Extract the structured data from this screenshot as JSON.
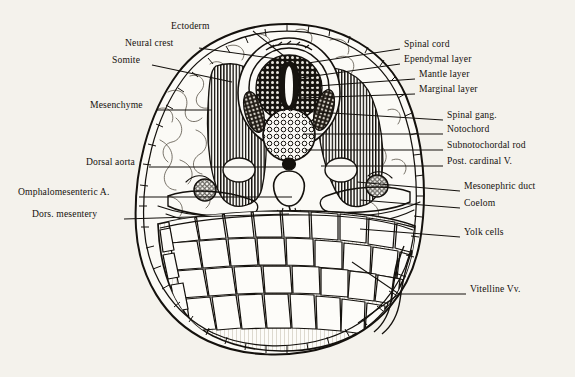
{
  "figure": {
    "clipped_header_text": "A 48, n 3 9",
    "background_color": "#f4f2ec",
    "ink_color": "#14110d"
  },
  "labels_left": [
    {
      "id": "ectoderm",
      "text": "Ectoderm",
      "text_x": 171,
      "text_y": 28,
      "anchor_x": 253,
      "anchor_y": 31,
      "tip_x": 284,
      "tip_y": 56
    },
    {
      "id": "neural-crest",
      "text": "Neural crest",
      "text_x": 125,
      "text_y": 45,
      "anchor_x": 199,
      "anchor_y": 48,
      "tip_x": 291,
      "tip_y": 61
    },
    {
      "id": "somite",
      "text": "Somite",
      "text_x": 112,
      "text_y": 62,
      "anchor_x": 152,
      "anchor_y": 65,
      "tip_x": 232,
      "tip_y": 82
    },
    {
      "id": "mesenchyme",
      "text": "Mesenchyme",
      "text_x": 90,
      "text_y": 107,
      "anchor_x": 157,
      "anchor_y": 110,
      "tip_x": 212,
      "tip_y": 110
    },
    {
      "id": "dorsal-aorta",
      "text": "Dorsal aorta",
      "text_x": 86,
      "text_y": 164,
      "anchor_x": 149,
      "anchor_y": 167,
      "tip_x": 288,
      "tip_y": 167
    },
    {
      "id": "omphalomesenteric-a",
      "text": "Omphalomesenteric A.",
      "text_x": 18,
      "text_y": 194,
      "anchor_x": 139,
      "anchor_y": 197,
      "tip_x": 292,
      "tip_y": 197
    },
    {
      "id": "dors-mesentery",
      "text": "Dors. mesentery",
      "text_x": 32,
      "text_y": 216,
      "anchor_x": 124,
      "anchor_y": 219,
      "tip_x": 289,
      "tip_y": 214
    }
  ],
  "labels_right": [
    {
      "id": "spinal-cord",
      "text": "Spinal cord",
      "text_x": 404,
      "text_y": 46,
      "anchor_x": 400,
      "anchor_y": 49,
      "tip_x": 308,
      "tip_y": 63
    },
    {
      "id": "ependymal-layer",
      "text": "Ependymal layer",
      "text_x": 404,
      "text_y": 61,
      "anchor_x": 400,
      "anchor_y": 64,
      "tip_x": 300,
      "tip_y": 78
    },
    {
      "id": "mantle-layer",
      "text": "Mantle layer",
      "text_x": 419,
      "text_y": 76,
      "anchor_x": 415,
      "anchor_y": 79,
      "tip_x": 303,
      "tip_y": 87
    },
    {
      "id": "marginal-layer",
      "text": "Marginal layer",
      "text_x": 419,
      "text_y": 91,
      "anchor_x": 415,
      "anchor_y": 94,
      "tip_x": 300,
      "tip_y": 98
    },
    {
      "id": "spinal-gang",
      "text": "Spinal gang.",
      "text_x": 447,
      "text_y": 117,
      "anchor_x": 443,
      "anchor_y": 120,
      "tip_x": 300,
      "tip_y": 111
    },
    {
      "id": "notochord",
      "text": "Notochord",
      "text_x": 447,
      "text_y": 131,
      "anchor_x": 443,
      "anchor_y": 134,
      "tip_x": 303,
      "tip_y": 134
    },
    {
      "id": "subnotochordal-rod",
      "text": "Subnotochordal rod",
      "text_x": 447,
      "text_y": 147,
      "anchor_x": 443,
      "anchor_y": 150,
      "tip_x": 305,
      "tip_y": 150
    },
    {
      "id": "post-cardinal-v",
      "text": "Post. cardinal V.",
      "text_x": 447,
      "text_y": 163,
      "anchor_x": 443,
      "anchor_y": 166,
      "tip_x": 321,
      "tip_y": 166
    },
    {
      "id": "mesonephric-duct",
      "text": "Mesonephric duct",
      "text_x": 464,
      "text_y": 188,
      "anchor_x": 460,
      "anchor_y": 191,
      "tip_x": 357,
      "tip_y": 182
    },
    {
      "id": "coelom",
      "text": "Coelom",
      "text_x": 464,
      "text_y": 205,
      "anchor_x": 460,
      "anchor_y": 208,
      "tip_x": 360,
      "tip_y": 200
    },
    {
      "id": "yolk-cells",
      "text": "Yolk cells",
      "text_x": 464,
      "text_y": 234,
      "anchor_x": 460,
      "anchor_y": 237,
      "tip_x": 360,
      "tip_y": 229
    },
    {
      "id": "vitelline-vv",
      "text": "Vitelline Vv.",
      "text_x": 470,
      "text_y": 291,
      "anchor_x": 466,
      "anchor_y": 294,
      "tip_x": 399,
      "tip_y": 294
    }
  ],
  "vitelline_forks": [
    {
      "from_x": 399,
      "from_y": 294,
      "to_x": 352,
      "to_y": 262
    },
    {
      "from_x": 399,
      "from_y": 294,
      "to_x": 358,
      "to_y": 323
    }
  ]
}
